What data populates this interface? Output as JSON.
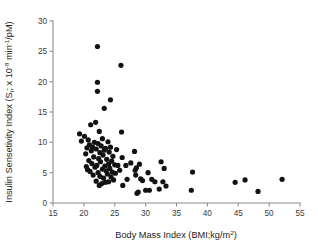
{
  "chart_data": {
    "type": "scatter",
    "title": "",
    "xlabel": "Body Mass Index (BMI;kg/m²)",
    "ylabel": "Insulin Sensetivity Index (Sᴵ; x 10⁻⁸ min⁻¹/pM)",
    "ylabel_parts": {
      "main_a": "Insulin Sensetivity Index (S",
      "sub_i": "I",
      "main_b": "; x 10",
      "sup_a": "-8",
      "main_c": " min",
      "sup_b": "-1",
      "main_d": "/pM)"
    },
    "xlabel_parts": {
      "main": "Body Mass Index (BMI;kg/m",
      "sup": "2",
      "tail": ")"
    },
    "xlim": [
      15,
      55
    ],
    "ylim": [
      0,
      30
    ],
    "xticks": [
      15,
      20,
      25,
      30,
      35,
      40,
      45,
      50,
      55
    ],
    "xtick_labels": [
      "15",
      "20",
      "25",
      "30",
      "35",
      "40",
      "45",
      "50",
      "55"
    ],
    "yticks": [
      0,
      5,
      10,
      15,
      20,
      25,
      30
    ],
    "ytick_labels": [
      "0",
      "5",
      "10",
      "15",
      "20",
      "25",
      "30"
    ],
    "grid": false,
    "legend": false,
    "marker": "circle",
    "marker_color": "#121212",
    "marker_size_px": 2.6,
    "axis_color": "#8b8b8b",
    "background": "#ffffff",
    "n_points": 96,
    "points": [
      [
        19.3,
        11.4
      ],
      [
        19.6,
        10.2
      ],
      [
        20.1,
        11.0
      ],
      [
        20.3,
        8.1
      ],
      [
        20.4,
        6.0
      ],
      [
        20.5,
        9.1
      ],
      [
        20.6,
        5.5
      ],
      [
        20.7,
        10.4
      ],
      [
        20.8,
        7.0
      ],
      [
        20.9,
        9.6
      ],
      [
        21.0,
        5.2
      ],
      [
        21.1,
        12.9
      ],
      [
        21.2,
        8.6
      ],
      [
        21.3,
        6.5
      ],
      [
        21.4,
        9.2
      ],
      [
        21.5,
        4.6
      ],
      [
        21.6,
        7.6
      ],
      [
        21.7,
        10.0
      ],
      [
        21.8,
        5.9
      ],
      [
        21.9,
        13.3
      ],
      [
        22.0,
        8.9
      ],
      [
        22.0,
        3.6
      ],
      [
        22.1,
        6.2
      ],
      [
        22.2,
        25.8
      ],
      [
        22.2,
        19.9
      ],
      [
        22.2,
        18.4
      ],
      [
        22.3,
        9.8
      ],
      [
        22.3,
        5.0
      ],
      [
        22.4,
        7.3
      ],
      [
        22.5,
        11.8
      ],
      [
        22.5,
        2.9
      ],
      [
        22.6,
        8.3
      ],
      [
        22.6,
        4.4
      ],
      [
        22.7,
        6.8
      ],
      [
        22.8,
        9.4
      ],
      [
        22.9,
        3.2
      ],
      [
        23.0,
        5.6
      ],
      [
        23.0,
        10.6
      ],
      [
        23.1,
        7.9
      ],
      [
        23.2,
        4.1
      ],
      [
        23.3,
        15.6
      ],
      [
        23.3,
        8.7
      ],
      [
        23.4,
        6.1
      ],
      [
        23.5,
        9.0
      ],
      [
        23.5,
        3.4
      ],
      [
        23.6,
        5.3
      ],
      [
        23.7,
        7.2
      ],
      [
        23.8,
        4.8
      ],
      [
        23.9,
        10.1
      ],
      [
        24.0,
        6.4
      ],
      [
        24.0,
        3.5
      ],
      [
        24.1,
        8.4
      ],
      [
        24.2,
        5.7
      ],
      [
        24.3,
        17.0
      ],
      [
        24.3,
        9.2
      ],
      [
        24.4,
        4.3
      ],
      [
        24.5,
        6.9
      ],
      [
        24.6,
        5.1
      ],
      [
        24.7,
        7.7
      ],
      [
        24.8,
        3.8
      ],
      [
        25.0,
        6.3
      ],
      [
        25.1,
        4.9
      ],
      [
        25.3,
        8.8
      ],
      [
        25.5,
        6.2
      ],
      [
        25.8,
        5.4
      ],
      [
        26.0,
        22.7
      ],
      [
        26.1,
        11.7
      ],
      [
        26.2,
        7.5
      ],
      [
        26.3,
        2.9
      ],
      [
        26.8,
        6.2
      ],
      [
        27.0,
        3.9
      ],
      [
        27.6,
        6.6
      ],
      [
        28.2,
        8.5
      ],
      [
        28.3,
        5.4
      ],
      [
        28.4,
        4.6
      ],
      [
        28.5,
        5.8
      ],
      [
        28.6,
        1.6
      ],
      [
        28.8,
        1.8
      ],
      [
        29.0,
        6.4
      ],
      [
        29.2,
        4.0
      ],
      [
        29.5,
        3.7
      ],
      [
        30.0,
        2.1
      ],
      [
        30.4,
        5.0
      ],
      [
        30.6,
        2.1
      ],
      [
        31.0,
        3.9
      ],
      [
        31.5,
        3.5
      ],
      [
        32.2,
        2.3
      ],
      [
        32.5,
        6.8
      ],
      [
        32.8,
        3.5
      ],
      [
        33.0,
        5.7
      ],
      [
        33.3,
        2.8
      ],
      [
        37.4,
        2.1
      ],
      [
        37.6,
        5.1
      ],
      [
        44.5,
        3.4
      ],
      [
        46.1,
        3.8
      ],
      [
        48.2,
        1.9
      ],
      [
        52.1,
        3.9
      ]
    ]
  },
  "axes_geometry": {
    "plot_left_px": 53,
    "plot_right_px": 300,
    "plot_top_px": 21,
    "plot_bottom_px": 203
  }
}
